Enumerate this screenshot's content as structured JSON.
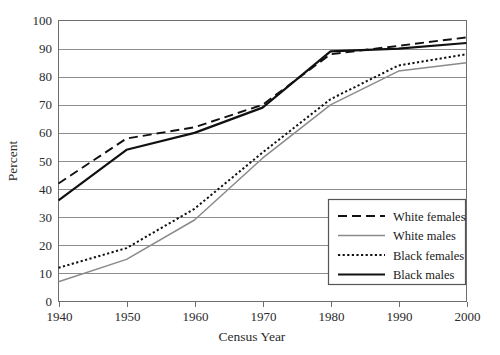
{
  "chart_data": {
    "type": "line",
    "title": "",
    "xlabel": "Census Year",
    "ylabel": "Percent",
    "x": [
      1940,
      1950,
      1960,
      1970,
      1980,
      1990,
      2000
    ],
    "xtick_labels": [
      "1940",
      "1950",
      "1960",
      "1970",
      "1980",
      "1990",
      "2000"
    ],
    "ytick_labels": [
      "0",
      "10",
      "20",
      "30",
      "40",
      "50",
      "60",
      "70",
      "80",
      "90",
      "100"
    ],
    "ylim": [
      0,
      100
    ],
    "xlim": [
      1940,
      2000
    ],
    "grid": "horizontal",
    "legend_position": "bottom-right",
    "series": [
      {
        "name": "White females",
        "style": "dashed",
        "color": "#111111",
        "values": [
          42,
          58,
          62,
          70,
          88,
          91,
          94
        ]
      },
      {
        "name": "White males",
        "style": "solid-gray",
        "color": "#8a8a8a",
        "values": [
          7,
          15,
          29,
          51,
          70,
          82,
          85
        ]
      },
      {
        "name": "Black females",
        "style": "dotted",
        "color": "#111111",
        "values": [
          12,
          19,
          33,
          53,
          72,
          84,
          88
        ]
      },
      {
        "name": "Black males",
        "style": "solid-black",
        "color": "#111111",
        "values": [
          36,
          54,
          60,
          69,
          89,
          90,
          92
        ]
      }
    ]
  },
  "legend": {
    "entries": [
      {
        "label": "White females"
      },
      {
        "label": "White males"
      },
      {
        "label": "Black females"
      },
      {
        "label": "Black males"
      }
    ]
  }
}
